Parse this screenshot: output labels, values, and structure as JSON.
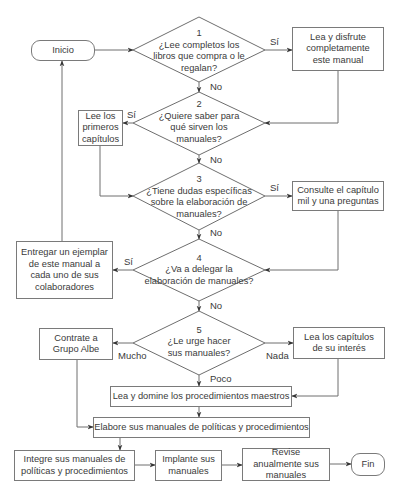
{
  "flowchart": {
    "start": {
      "label": "Inicio"
    },
    "end": {
      "label": "Fin"
    },
    "decisions": [
      {
        "number": "1",
        "question": "¿Lee completos los libros que compra o le regalan?"
      },
      {
        "number": "2",
        "question": "¿Quiere saber para qué sirven los manuales?"
      },
      {
        "number": "3",
        "question": "¿Tiene dudas específicas sobre la elaboración de manuales?"
      },
      {
        "number": "4",
        "question": "¿Va a delegar la elaboración de manuales?"
      },
      {
        "number": "5",
        "question": "¿Le urge hacer sus manuales?"
      }
    ],
    "processes": {
      "enjoy_manual": "Lea y disfrute completamente este manual",
      "read_first_chapters": "Lee los primeros capítulos",
      "consult_chapter": "Consulte el capítulo mil y una preguntas",
      "deliver_copy": "Entregar un ejemplar de este manual a cada uno de sus colaboradores",
      "hire_albe": "Contrate a Grupo Albe",
      "read_interest_chapters": "Lea los capítulos de su interés",
      "master_procedures": "Lea y domine los procedimientos maestros",
      "elaborate_manuals": "Elabore sus manuales de políticas y procedimientos",
      "integrate_manuals": "Integre sus manuales de políticas y procedimientos",
      "implement_manuals": "Implante sus manuales",
      "review_manuals": "Revise anualmente sus manuales"
    },
    "edge_labels": {
      "d1_yes": "Sí",
      "d1_no": "No",
      "d2_yes": "Sí",
      "d2_no": "No",
      "d3_yes": "Sí",
      "d3_no": "No",
      "d4_yes": "Sí",
      "d4_no": "No",
      "d5_much": "Mucho",
      "d5_none": "Nada",
      "d5_little": "Poco"
    },
    "colors": {
      "line": "#6e6e6e",
      "text": "#3a3a3a",
      "background": "#ffffff"
    }
  }
}
